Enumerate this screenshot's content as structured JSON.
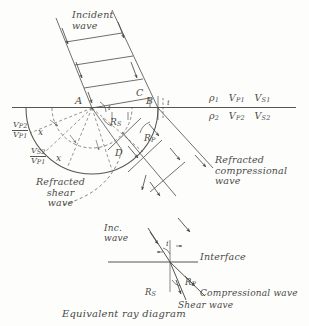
{
  "figure": {
    "caption": "Equivalent ray diagram",
    "style": "hand-drawn seismic wavefront refraction construction"
  },
  "top_panel": {
    "incident_label": [
      "Incident",
      "wave"
    ],
    "points": [
      "A",
      "C",
      "B",
      "D"
    ],
    "angles": {
      "incident": "i",
      "refracted_shear": "R",
      "refracted_shear_sub": "S",
      "refracted_compressional": "R",
      "refracted_compressional_sub": "P"
    },
    "medium_upper": {
      "density": "ρ",
      "density_sub": "1",
      "vp": "V",
      "vp_sub": "P1",
      "vs": "V",
      "vs_sub": "S1"
    },
    "medium_lower": {
      "density": "ρ",
      "density_sub": "2",
      "vp": "V",
      "vp_sub": "P2",
      "vs": "V",
      "vs_sub": "S2"
    },
    "radius_labels": [
      {
        "num": "V",
        "num_sub": "P2",
        "den": "V",
        "den_sub": "P1",
        "times": "x"
      },
      {
        "num": "V",
        "num_sub": "S2",
        "den": "V",
        "den_sub": "P1",
        "times": "x"
      }
    ],
    "refracted_shear_label": [
      "Refracted",
      "shear",
      "wave"
    ],
    "refracted_compressional_label": [
      "Refracted",
      "compressional",
      "wave"
    ]
  },
  "bottom_panel": {
    "incident_label": [
      "Inc.",
      "wave"
    ],
    "incident_angle": "i",
    "interface_label": "Interface",
    "shear_angle": "R",
    "shear_angle_sub": "S",
    "compressional_angle": "R",
    "compressional_angle_sub": "P",
    "compressional_wave_label": "Compressional wave",
    "shear_wave_label": "Shear wave",
    "caption": "Equivalent ray diagram"
  },
  "colors": {
    "ink": "#4a4a48",
    "line": "#55554f",
    "paper": "#fdfdfb",
    "dash": "#6b6b66"
  }
}
